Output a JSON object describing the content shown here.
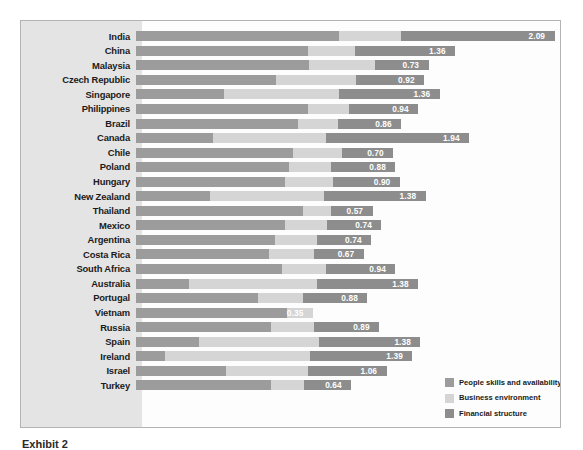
{
  "chart_data": {
    "type": "bar",
    "orientation": "horizontal",
    "stacked": true,
    "title": "",
    "xlabel": "",
    "ylabel": "",
    "grid": false,
    "legend_position": "bottom-right",
    "categories": [
      "India",
      "China",
      "Malaysia",
      "Czech Republic",
      "Singapore",
      "Philippines",
      "Brazil",
      "Canada",
      "Chile",
      "Poland",
      "Hungary",
      "New Zealand",
      "Thailand",
      "Mexico",
      "Argentina",
      "Costa Rica",
      "South Africa",
      "Australia",
      "Portugal",
      "Vietnam",
      "Russia",
      "Spain",
      "Ireland",
      "Israel",
      "Turkey"
    ],
    "series": [
      {
        "name": "People skills and availability",
        "color": "#9c9c9c",
        "values": [
          2.76,
          2.33,
          2.35,
          1.9,
          1.19,
          2.34,
          2.2,
          1.04,
          2.13,
          2.08,
          2.02,
          1.01,
          2.27,
          2.02,
          1.88,
          1.8,
          1.98,
          0.72,
          1.66,
          2.05,
          1.83,
          0.85,
          0.4,
          1.22,
          1.83
        ]
      },
      {
        "name": "Business environment",
        "color": "#d5d5d5",
        "values": [
          0.83,
          0.64,
          0.89,
          1.09,
          1.57,
          0.55,
          0.54,
          1.54,
          0.66,
          0.56,
          0.66,
          1.54,
          0.37,
          0.57,
          0.57,
          0.62,
          0.6,
          1.73,
          0.6,
          0.35,
          0.58,
          1.63,
          1.96,
          1.12,
          0.45
        ]
      },
      {
        "name": "Financial structure",
        "color": "#8d8d8d",
        "values": [
          2.09,
          1.36,
          0.73,
          0.92,
          1.36,
          0.94,
          0.86,
          1.94,
          0.7,
          0.88,
          0.9,
          1.38,
          0.57,
          0.74,
          0.74,
          0.67,
          0.94,
          1.38,
          0.88,
          0.0,
          0.89,
          1.38,
          1.39,
          1.06,
          0.64
        ]
      }
    ],
    "value_labels": [
      "2.09",
      "1.36",
      "0.73",
      "0.92",
      "1.36",
      "0.94",
      "0.86",
      "1.94",
      "0.70",
      "0.88",
      "0.90",
      "1.38",
      "0.57",
      "0.74",
      "0.74",
      "0.67",
      "0.94",
      "1.38",
      "0.88",
      "0.35",
      "0.89",
      "1.38",
      "1.39",
      "1.06",
      "0.64"
    ],
    "xlim": [
      0,
      5.7
    ]
  },
  "legend": {
    "items": [
      {
        "label": "People skills and availability",
        "swatch": "s1"
      },
      {
        "label": "Business environment",
        "swatch": "s2"
      },
      {
        "label": "Financial structure",
        "swatch": "s3"
      }
    ]
  },
  "caption": {
    "text": "Exhibit 2 "
  },
  "colors": {
    "series1": "#9c9c9c",
    "series2": "#d5d5d5",
    "series3": "#8d8d8d",
    "panel": "#eeeeee",
    "gutter": "#e4e4e4",
    "plot": "#fdfdfd",
    "border": "#b4b4b4",
    "value_text": "#ffffff",
    "label_text": "#1b1b1b"
  }
}
